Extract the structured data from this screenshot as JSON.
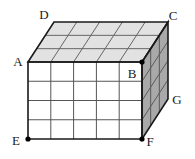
{
  "figure": {
    "colors": {
      "front_face": "#ffffff",
      "top_face": "#e2e2e2",
      "right_face": "#a9a9a9",
      "outline": "#1a1a1a",
      "grid_line": "#555555",
      "background": "#ffffff",
      "label_text": "#1a1a1a",
      "marker_dot": "#000000"
    },
    "grid": {
      "width_cells": 5,
      "height_cells": 4,
      "depth_cells": 3
    },
    "faces": [
      {
        "name": "front-face",
        "fill": "#ffffff",
        "cols": 5,
        "rows": 4
      },
      {
        "name": "top-face",
        "fill": "#e2e2e2",
        "cols": 5,
        "rows": 3
      },
      {
        "name": "right-face",
        "fill": "#a9a9a9",
        "cols": 3,
        "rows": 4
      }
    ],
    "vertices": [
      {
        "id": "A",
        "label": "A",
        "x": 28,
        "y": 62,
        "label_x": 18,
        "label_y": 66,
        "dot": false
      },
      {
        "id": "B",
        "label": "B",
        "x": 142,
        "y": 62,
        "label_x": 132,
        "label_y": 78,
        "dot": true
      },
      {
        "id": "C",
        "label": "C",
        "x": 168,
        "y": 22,
        "label_x": 173,
        "label_y": 20,
        "dot": false
      },
      {
        "id": "D",
        "label": "D",
        "x": 54,
        "y": 22,
        "label_x": 44,
        "label_y": 19,
        "dot": false
      },
      {
        "id": "E",
        "label": "E",
        "x": 28,
        "y": 139,
        "label_x": 16,
        "label_y": 145,
        "dot": true
      },
      {
        "id": "F",
        "label": "F",
        "x": 142,
        "y": 139,
        "label_x": 148,
        "label_y": 146,
        "dot": true
      },
      {
        "id": "G",
        "label": "G",
        "x": 168,
        "y": 99,
        "label_x": 174,
        "label_y": 104,
        "dot": false
      }
    ],
    "edges": [
      {
        "name": "edge-A-B",
        "from": "A",
        "to": "B"
      },
      {
        "name": "edge-B-F",
        "from": "B",
        "to": "F"
      },
      {
        "name": "edge-F-E",
        "from": "F",
        "to": "E"
      },
      {
        "name": "edge-E-A",
        "from": "E",
        "to": "A"
      },
      {
        "name": "edge-A-D",
        "from": "A",
        "to": "D"
      },
      {
        "name": "edge-D-C",
        "from": "D",
        "to": "C"
      },
      {
        "name": "edge-C-B",
        "from": "C",
        "to": "B"
      },
      {
        "name": "edge-C-G",
        "from": "C",
        "to": "G"
      },
      {
        "name": "edge-G-F",
        "from": "G",
        "to": "F"
      }
    ]
  }
}
